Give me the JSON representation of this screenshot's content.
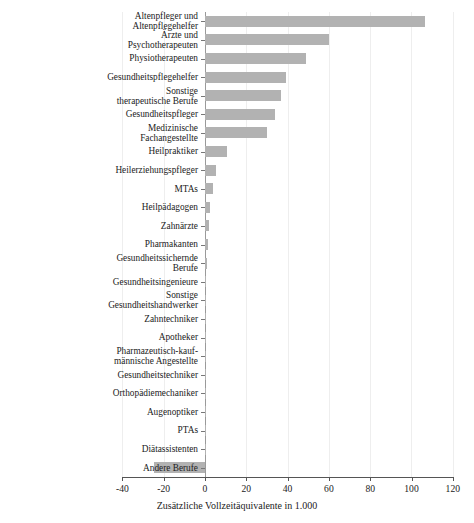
{
  "chart_data": {
    "type": "bar",
    "orientation": "horizontal",
    "title": "",
    "subtitle": "",
    "xlabel": "Zusätzliche Vollzeitäquivalente in 1.000",
    "ylabel": "",
    "xlim": [
      -40,
      120
    ],
    "xticks": [
      -40,
      -20,
      0,
      20,
      40,
      60,
      80,
      100,
      120
    ],
    "xtick_labels": [
      "-40",
      "-20",
      "0",
      "20",
      "40",
      "60",
      "80",
      "100",
      "120"
    ],
    "grid": true,
    "grid_axis": "x",
    "legend": null,
    "bar_color": "#b2b2b2",
    "categories": [
      "Altenpfleger und\nAltenpflegehelfer",
      "Ärzte und\nPsychotherapeuten",
      "Physiotherapeuten",
      "Gesundheitspflegehelfer",
      "Sonstige\ntherapeutische Berufe",
      "Gesundheitspfleger",
      "Medizinische\nFachangestellte",
      "Heilpraktiker",
      "Heilerziehungspfleger",
      "MTAs",
      "Heilpädagogen",
      "Zahnärzte",
      "Pharmakanten",
      "Gesundheitssichernde\nBerufe",
      "Gesundheitsingenieure",
      "Sonstige\nGesundheitshandwerker",
      "Zahntechniker",
      "Apotheker",
      "Pharmazeutisch-kauf-\nmännische Angestellte",
      "Gesundheitstechniker",
      "Orthopädiemechaniker",
      "Augenoptiker",
      "PTAs",
      "Diätassistenten",
      "Andere Berufe"
    ],
    "values": [
      106.5,
      60.0,
      49.0,
      39.0,
      37.0,
      34.0,
      30.0,
      10.5,
      5.3,
      3.8,
      2.2,
      2.0,
      1.4,
      0.9,
      0.7,
      0.6,
      0.5,
      0.4,
      0.4,
      0.3,
      0.3,
      0.2,
      0.2,
      0.1,
      -24.5
    ],
    "value_unit": "Tausend Vollzeitäquivalente"
  }
}
